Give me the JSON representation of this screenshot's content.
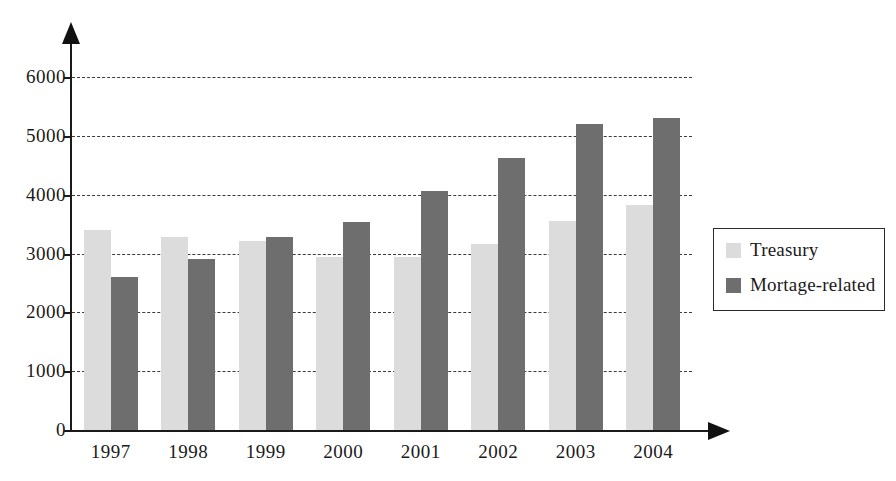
{
  "chart_data": {
    "type": "bar",
    "title": "",
    "subtitle": "",
    "xlabel": "",
    "ylabel": "",
    "categories": [
      "1997",
      "1998",
      "1999",
      "2000",
      "2001",
      "2002",
      "2003",
      "2004"
    ],
    "series": [
      {
        "name": "Treasury",
        "color": "#dcdcdc",
        "values": [
          3400,
          3290,
          3210,
          2950,
          2950,
          3170,
          3560,
          3830
        ]
      },
      {
        "name": "Mortage-related",
        "color": "#6e6e6e",
        "values": [
          2600,
          2900,
          3280,
          3540,
          4070,
          4620,
          5210,
          5300
        ]
      }
    ],
    "ylim": [
      0,
      6400
    ],
    "yticks": [
      0,
      1000,
      2000,
      3000,
      4000,
      5000,
      6000
    ],
    "ytick_labels": [
      "0",
      "1000",
      "2000",
      "3000",
      "4000",
      "5000",
      "6000"
    ],
    "grid": "horizontal-dashed",
    "grid_color": "#3a3a3a",
    "legend_position": "right",
    "axis_color": "#1a1a1a",
    "background": "#ffffff"
  },
  "legend": {
    "entries": [
      {
        "label": "Treasury",
        "color": "#dcdcdc"
      },
      {
        "label": "Mortage-related",
        "color": "#6e6e6e"
      }
    ]
  },
  "footer": {
    "source_note": ""
  }
}
